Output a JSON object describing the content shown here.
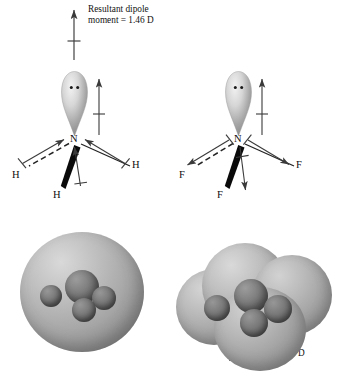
{
  "figure": {
    "type": "chemistry-structure-diagram",
    "background": "#ffffff"
  },
  "molecules": {
    "left": {
      "name": "ammonia",
      "formula": "NH3",
      "center_atom": "N",
      "center_label": "N",
      "resultant_direction": "up",
      "resultant_value": "1.46 D",
      "caption_line1": "Resultant dipole",
      "caption_line2": "moment = 1.46 D",
      "bond_dipole_direction": "toward-nitrogen",
      "substituents": [
        {
          "label": "H",
          "position": "left",
          "bond_style": "dashed"
        },
        {
          "label": "H",
          "position": "right",
          "bond_style": "plain"
        },
        {
          "label": "H",
          "position": "bottom",
          "bond_style": "wedge"
        }
      ],
      "lone_pair": {
        "electrons": 2,
        "dipole_direction": "up"
      }
    },
    "right": {
      "name": "nitrogen trifluoride",
      "formula": "NF3",
      "center_atom": "N",
      "center_label": "N",
      "resultant_direction": "down",
      "resultant_value": "0.24 D",
      "caption_line1": "Resultant dipole",
      "caption_line2": "moment = 0.24 D",
      "bond_dipole_direction": "away-from-nitrogen",
      "substituents": [
        {
          "label": "F",
          "position": "left",
          "bond_style": "dashed"
        },
        {
          "label": "F",
          "position": "right",
          "bond_style": "plain"
        },
        {
          "label": "F",
          "position": "bottom",
          "bond_style": "wedge"
        }
      ],
      "lone_pair": {
        "electrons": 2,
        "dipole_direction": "up"
      }
    }
  },
  "space_filling_models": {
    "left": {
      "molecule": "NH3",
      "surface_shape": "single-rounded",
      "atom_count": 4,
      "surface_color": "#a8a8a8",
      "atom_color": "#6b6b6b"
    },
    "right": {
      "molecule": "NF3",
      "surface_shape": "multi-lobed",
      "atom_count": 4,
      "surface_color": "#a8a8a8",
      "atom_color": "#6b6b6b"
    }
  },
  "colors": {
    "ink": "#121212",
    "arrow": "#3a3a3a",
    "bond": "#2b2b2b",
    "lobe_light": "#e6e6e6",
    "lobe_dark": "#8e8e8e"
  }
}
